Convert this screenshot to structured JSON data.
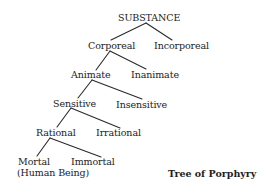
{
  "diagram": {
    "title": "Tree of Porphyry",
    "nodes": {
      "substance": "SUBSTANCE",
      "corporeal": "Corporeal",
      "incorporeal": "Incorporeal",
      "animate": "Animate",
      "inanimate": "Inanimate",
      "sensitive": "Sensitive",
      "insensitive": "Insensitive",
      "rational": "Rational",
      "irrational": "Irrational",
      "mortal": "Mortal",
      "mortal_note": "(Human Being)",
      "immortal": "Immortal"
    },
    "edges": [
      [
        "SUBSTANCE",
        "Corporeal"
      ],
      [
        "SUBSTANCE",
        "Incorporeal"
      ],
      [
        "Corporeal",
        "Animate"
      ],
      [
        "Corporeal",
        "Inanimate"
      ],
      [
        "Animate",
        "Sensitive"
      ],
      [
        "Animate",
        "Insensitive"
      ],
      [
        "Sensitive",
        "Rational"
      ],
      [
        "Sensitive",
        "Irrational"
      ],
      [
        "Rational",
        "Mortal"
      ],
      [
        "Rational",
        "Immortal"
      ]
    ]
  }
}
